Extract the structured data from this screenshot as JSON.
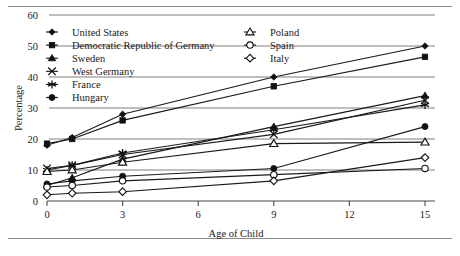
{
  "figure": {
    "rules": [
      "top-rule",
      "bottom-rule"
    ]
  },
  "chart_data": {
    "type": "line",
    "title": "",
    "xlabel": "Age of Child",
    "ylabel": "Percentage",
    "x": [
      0,
      1,
      3,
      9,
      15
    ],
    "xticks": [
      0,
      3,
      6,
      9,
      12,
      15
    ],
    "yticks": [
      0,
      10,
      20,
      30,
      40,
      50,
      60
    ],
    "xlim": [
      0,
      15
    ],
    "ylim": [
      0,
      60
    ],
    "grid": "horizontal",
    "legend_position": "upper-left-and-upper-center",
    "series": [
      {
        "name": "United States",
        "marker": "filled-diamond",
        "values": [
          18,
          20.5,
          28,
          40,
          50
        ]
      },
      {
        "name": "Democratic Republic of Germany",
        "marker": "filled-square",
        "values": [
          18.5,
          20,
          26,
          37,
          46.5
        ]
      },
      {
        "name": "Sweden",
        "marker": "filled-triangle",
        "values": [
          5,
          7.5,
          13.5,
          24,
          34
        ]
      },
      {
        "name": "West Germany",
        "marker": "cross-x",
        "values": [
          10.5,
          11.5,
          15,
          21.5,
          32.5
        ]
      },
      {
        "name": "France",
        "marker": "asterisk",
        "values": [
          10,
          11.5,
          15.5,
          23,
          31
        ]
      },
      {
        "name": "Hungary",
        "marker": "filled-circle",
        "values": [
          5.5,
          6.5,
          8,
          10.5,
          24
        ]
      },
      {
        "name": "Poland",
        "marker": "open-triangle",
        "values": [
          9.5,
          10,
          12.5,
          18.5,
          19
        ]
      },
      {
        "name": "Spain",
        "marker": "open-circle",
        "values": [
          4.5,
          5,
          6.5,
          8.5,
          10.5
        ]
      },
      {
        "name": "Italy",
        "marker": "open-diamond",
        "values": [
          2,
          2.5,
          3,
          6.5,
          14
        ]
      }
    ]
  },
  "legend": {
    "column_left": [
      "United States",
      "Democratic Republic of Germany",
      "Sweden",
      "West Germany",
      "France",
      "Hungary"
    ],
    "column_right": [
      "Poland",
      "Spain",
      "Italy"
    ]
  }
}
